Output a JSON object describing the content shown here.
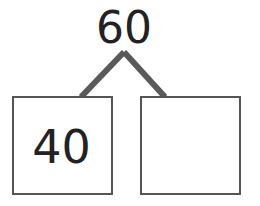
{
  "number_bond": {
    "whole": "60",
    "parts": [
      {
        "value": "40"
      },
      {
        "value": ""
      }
    ]
  },
  "colors": {
    "text": "#222222",
    "box_border": "#555555",
    "connector": "#5a5a5a",
    "background": "#ffffff"
  }
}
